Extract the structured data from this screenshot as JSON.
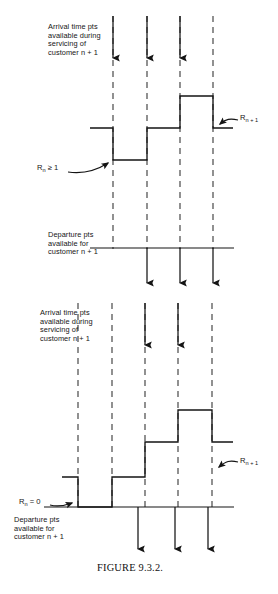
{
  "figure": {
    "caption": "FIGURE 9.3.2.",
    "stroke_color": "#1a1a1a",
    "background_color": "#ffffff",
    "dash_color": "#2b2b2b"
  },
  "panels": [
    {
      "id": "upper",
      "name": "upper-panel",
      "arrival_label": "Arrival time pts\navailable during\nservicing of\ncustomer n + 1",
      "departure_label": "Departure pts\navailable for\ncustomer n + 1",
      "rn_label_text": "Rn ≥ 1",
      "rn_label_base": "R",
      "rn_label_sub": "n",
      "rn_label_rest": " ≥ 1",
      "rn1_label_base": "R",
      "rn1_label_sub": "n + 1",
      "dashed_lines_x": [
        113,
        147,
        180,
        213
      ],
      "arrival_arrows_x": [
        113,
        147,
        180
      ],
      "departure_arrows_x": [
        147,
        180,
        213
      ],
      "departure_axis": {
        "x1": 90,
        "x2": 234,
        "y": 248
      },
      "step_points": [
        [
          90,
          128
        ],
        [
          113,
          128
        ],
        [
          113,
          160
        ],
        [
          147,
          160
        ],
        [
          147,
          128
        ],
        [
          180,
          128
        ],
        [
          180,
          96
        ],
        [
          213,
          96
        ],
        [
          213,
          128
        ],
        [
          233,
          128
        ]
      ]
    },
    {
      "id": "lower",
      "name": "lower-panel",
      "arrival_label": "Arrival time pts\navailable during\nservicing of\ncustomer n + 1",
      "departure_label": "Departure pts\navailable for\ncustomer n + 1",
      "rn_label_base": "R",
      "rn_label_sub": "n",
      "rn_label_rest": " = 0",
      "rn1_label_base": "R",
      "rn1_label_sub": "n + 1",
      "dashed_lines_x": [
        78,
        112,
        145,
        178,
        212
      ],
      "arrival_arrows_x": [
        145,
        178
      ],
      "departure_arrows_x": [
        138,
        175,
        208
      ],
      "departure_axis": {
        "x1": 44,
        "x2": 234,
        "y": 507
      },
      "step_points": [
        [
          62,
          477
        ],
        [
          78,
          477
        ],
        [
          78,
          507
        ],
        [
          112,
          507
        ],
        [
          112,
          477
        ],
        [
          145,
          477
        ],
        [
          145,
          442
        ],
        [
          178,
          442
        ],
        [
          178,
          410
        ],
        [
          212,
          410
        ],
        [
          212,
          442
        ],
        [
          233,
          442
        ]
      ]
    }
  ],
  "icons": {
    "arrow_down": "arrow-down-icon",
    "arrow_left": "arrow-left-icon",
    "arrow_right": "arrow-right-icon"
  }
}
